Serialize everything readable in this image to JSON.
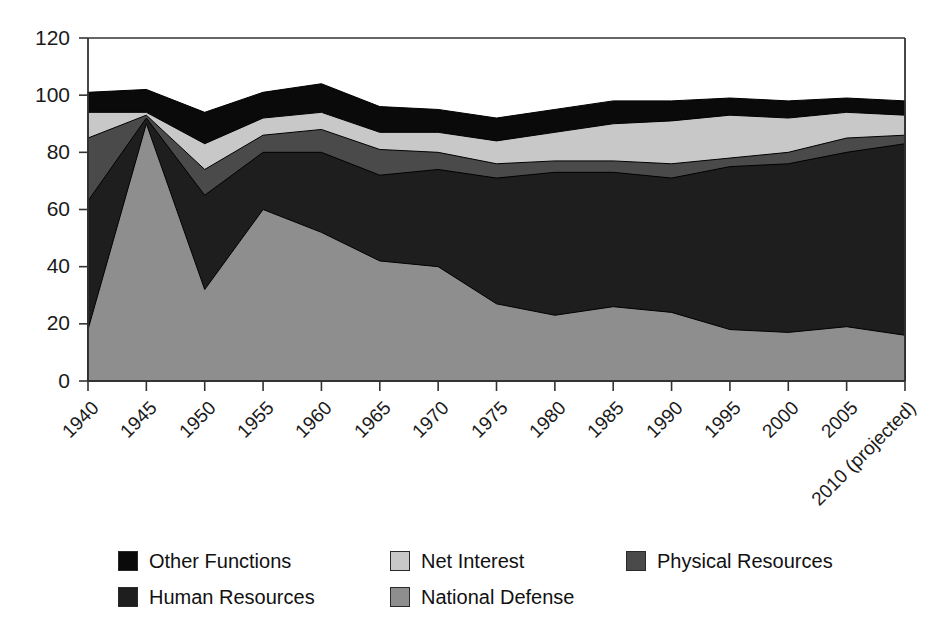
{
  "chart_data": {
    "type": "area",
    "stacked": true,
    "title": "",
    "subtitle": "",
    "xlabel": "",
    "ylabel": "",
    "ylim": [
      0,
      120
    ],
    "ytick_labels": [
      "0",
      "20",
      "40",
      "60",
      "80",
      "100",
      "120"
    ],
    "ytick_values": [
      0,
      20,
      40,
      60,
      80,
      100,
      120
    ],
    "grid": false,
    "legend_position": "bottom",
    "categories": [
      "1940",
      "1945",
      "1950",
      "1955",
      "1960",
      "1965",
      "1970",
      "1975",
      "1980",
      "1985",
      "1990",
      "1995",
      "2000",
      "2005",
      "2010 (projected)"
    ],
    "stack_order_bottom_to_top": [
      "National Defense",
      "Human Resources",
      "Physical Resources",
      "Net Interest",
      "Other Functions"
    ],
    "series": [
      {
        "name": "National Defense",
        "color": "#8e8e8e",
        "values": [
          18,
          90,
          32,
          60,
          52,
          42,
          40,
          27,
          23,
          26,
          24,
          18,
          17,
          19,
          16
        ]
      },
      {
        "name": "Human Resources",
        "color": "#1e1e1e",
        "values": [
          45,
          2,
          33,
          20,
          28,
          30,
          34,
          44,
          50,
          47,
          47,
          57,
          59,
          61,
          67
        ]
      },
      {
        "name": "Physical Resources",
        "color": "#4a4a4a",
        "values": [
          22,
          1,
          9,
          6,
          8,
          9,
          6,
          5,
          4,
          4,
          5,
          3,
          4,
          5,
          3
        ]
      },
      {
        "name": "Net Interest",
        "color": "#c8c8c8",
        "values": [
          9,
          1,
          9,
          6,
          6,
          6,
          7,
          8,
          10,
          13,
          15,
          15,
          12,
          9,
          7
        ]
      },
      {
        "name": "Other Functions",
        "color": "#0a0a0a",
        "values": [
          7,
          8,
          11,
          9,
          10,
          9,
          8,
          8,
          8,
          8,
          7,
          6,
          6,
          5,
          5
        ]
      }
    ],
    "cumulative_tops": {
      "National Defense": [
        18,
        90,
        32,
        60,
        52,
        42,
        40,
        27,
        23,
        26,
        24,
        18,
        17,
        19,
        16
      ],
      "Human Resources": [
        63,
        92,
        65,
        80,
        80,
        72,
        74,
        71,
        73,
        73,
        71,
        75,
        76,
        80,
        83
      ],
      "Physical Resources": [
        85,
        93,
        74,
        86,
        88,
        81,
        80,
        76,
        77,
        77,
        76,
        78,
        80,
        85,
        86
      ],
      "Net Interest": [
        94,
        94,
        83,
        92,
        94,
        87,
        87,
        84,
        87,
        90,
        91,
        93,
        92,
        94,
        93
      ],
      "Other Functions": [
        101,
        102,
        94,
        101,
        104,
        96,
        95,
        92,
        95,
        98,
        98,
        99,
        98,
        99,
        98
      ]
    }
  },
  "legend": {
    "items": [
      {
        "label": "Other Functions",
        "color": "#0a0a0a"
      },
      {
        "label": "Human Resources",
        "color": "#1e1e1e"
      },
      {
        "label": "Net Interest",
        "color": "#c8c8c8"
      },
      {
        "label": "National Defense",
        "color": "#8e8e8e"
      },
      {
        "label": "Physical Resources",
        "color": "#4a4a4a"
      }
    ]
  },
  "axis": {
    "frame_color": "#333333",
    "tick_color": "#333333"
  }
}
